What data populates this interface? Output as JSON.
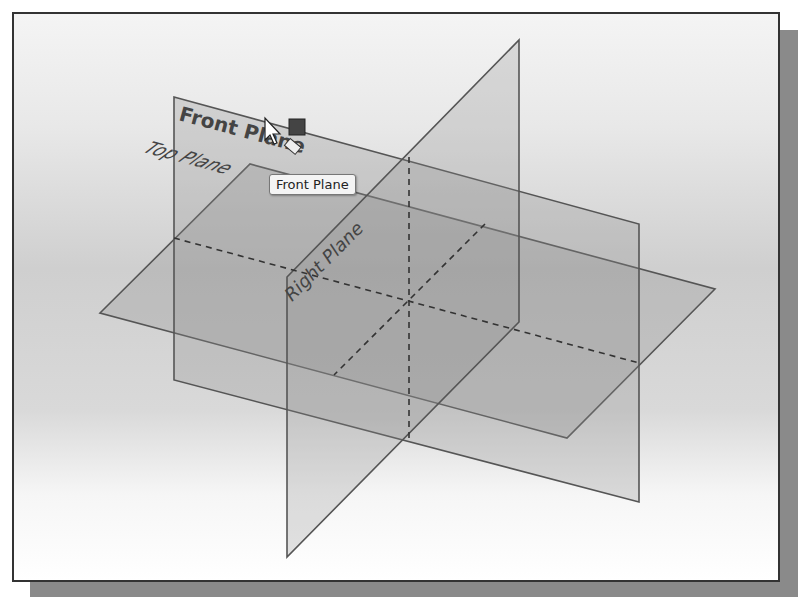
{
  "viewport": {
    "planes": [
      {
        "name": "Front Plane",
        "label": "Front Plane"
      },
      {
        "name": "Top Plane",
        "label": "Top Plane"
      },
      {
        "name": "Right Plane",
        "label": "Right Plane"
      }
    ],
    "tooltip": "Front Plane",
    "colors": {
      "plane_fill": "#a8a8a8",
      "edge": "#555555",
      "label": "#444444"
    }
  },
  "background_text": {
    "line1": "On your own, save the current model using the file",
    "line2": "name Block"
  }
}
